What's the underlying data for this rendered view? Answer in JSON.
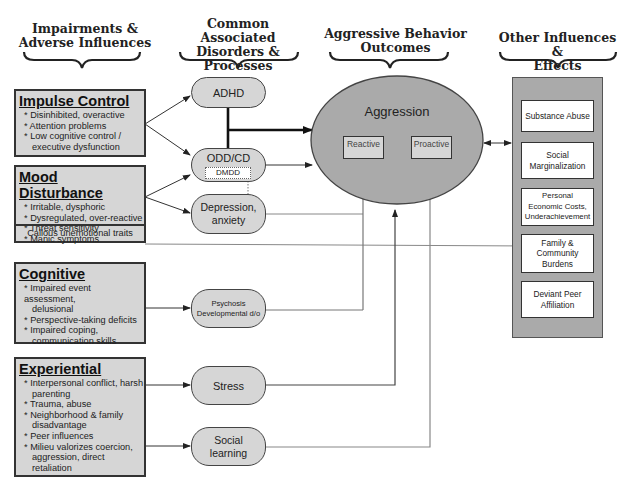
{
  "headers": [
    {
      "id": "impairments",
      "lines": [
        "Impairments &",
        "Adverse Influences"
      ]
    },
    {
      "id": "disorders",
      "lines": [
        "Common Associated",
        "Disorders &",
        "Processes"
      ]
    },
    {
      "id": "outcomes",
      "lines": [
        "Aggressive Behavior",
        "Outcomes"
      ]
    },
    {
      "id": "other",
      "lines": [
        "Other Influences &",
        "Effects"
      ]
    }
  ],
  "impairments": [
    {
      "title": "Impulse Control",
      "items": [
        "* Disinhibited, overactive",
        "* Attention problems",
        "* Low cognitive control /",
        "executive dysfunction"
      ]
    },
    {
      "title": "Mood Disturbance",
      "items": [
        "* Irritable, dysphoric",
        "* Dysregulated,  over-reactive",
        "* Threat sensitivity",
        "* Manic symptoms"
      ],
      "footer": "Callous unemotional traits"
    },
    {
      "title": "Cognitive",
      "items": [
        "* Impaired event assessment,",
        "delusional",
        "* Perspective-taking deficits",
        "*  Impaired coping,",
        "communication skills"
      ]
    },
    {
      "title": "Experiential",
      "items": [
        "* Interpersonal conflict, harsh",
        "parenting",
        "*  Trauma, abuse",
        "*  Neighborhood & family",
        "disadvantage",
        "*  Peer influences",
        "*  Milieu valorizes coercion,",
        "aggression, direct retaliation"
      ]
    }
  ],
  "processes": [
    {
      "id": "adhd",
      "lines": [
        "ADHD"
      ]
    },
    {
      "id": "oddcd",
      "lines": [
        "ODD/CD"
      ],
      "sub": "DMDD"
    },
    {
      "id": "depression",
      "lines": [
        "Depression,",
        "anxiety"
      ]
    },
    {
      "id": "psychosis",
      "lines": [
        "Psychosis",
        "Developmental d/o"
      ]
    },
    {
      "id": "stress",
      "lines": [
        "Stress"
      ]
    },
    {
      "id": "social",
      "lines": [
        "Social",
        "learning"
      ]
    }
  ],
  "aggression": {
    "title": "Aggression",
    "subtypes": [
      "Reactive",
      "Proactive"
    ]
  },
  "effects": [
    {
      "lines": [
        "Substance Abuse"
      ]
    },
    {
      "lines": [
        "Social",
        "Marginalization"
      ]
    },
    {
      "lines": [
        "Personal",
        "Economic Costs,",
        "Underachievement"
      ]
    },
    {
      "lines": [
        "Family &",
        "Community",
        "Burdens"
      ]
    },
    {
      "lines": [
        "Deviant Peer",
        "Affiliation"
      ]
    }
  ],
  "colors": {
    "box_fill": "#d6d6d6",
    "ellipse_fill": "#aaaaaa",
    "panel_fill": "#aaaaaa",
    "border": "#333333",
    "line": "#444444",
    "line_light": "#777777"
  }
}
